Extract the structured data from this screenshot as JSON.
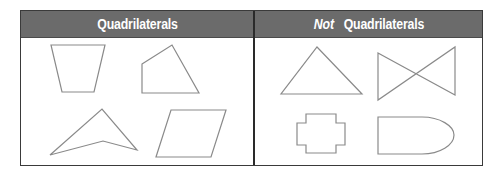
{
  "table": {
    "columns": [
      {
        "label": "Quadrilaterals",
        "emphasis": "",
        "shapes": [
          "trapezoid",
          "irregular-quadrilateral",
          "concave-dart",
          "parallelogram"
        ]
      },
      {
        "label": "Quadrilaterals",
        "emphasis": "Not",
        "shapes": [
          "triangle",
          "bowtie-crossed-quadrilateral",
          "cross-polygon",
          "bullet-curved-shape"
        ]
      }
    ]
  },
  "colors": {
    "header_background": "#6b6b6b",
    "header_text": "#ffffff",
    "border": "#3a3a3a",
    "shape_stroke": "#8a8a8a"
  }
}
